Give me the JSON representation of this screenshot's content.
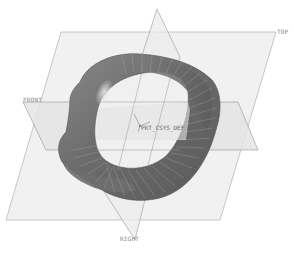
{
  "viewport": {
    "background": "#ffffff",
    "model": "mobius-strip-sweep"
  },
  "datum_planes": {
    "top": {
      "label": "TOP",
      "fill": "#eeeeee",
      "stroke": "#9a9a9a"
    },
    "front": {
      "label": "FRONT",
      "fill": "#e4e4e4",
      "stroke": "#8c8c8c"
    },
    "right": {
      "label": "RIGHT",
      "fill": "#e8e8e8",
      "stroke": "#8c8c8c"
    }
  },
  "coordinate_system": {
    "label": "PRT_CSYS_DEF",
    "axes": [
      "X",
      "Y",
      "Z"
    ]
  },
  "colors": {
    "surface_dark": "#5e5e5e",
    "surface_mid": "#7d7d7d",
    "surface_light": "#a0a0a0",
    "highlight": "#d8d8d8",
    "edge_lines": "#bdbdbd"
  },
  "caption": {
    "text": ""
  }
}
